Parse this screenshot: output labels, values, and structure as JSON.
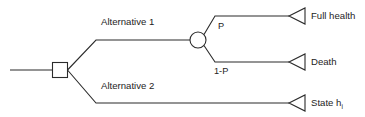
{
  "diagram": {
    "type": "decision-tree",
    "title": "",
    "colors": {
      "stroke": "#2b2b2b",
      "background": "#ffffff",
      "text": "#1d1d1d"
    },
    "nodes": {
      "root": {
        "shape": "square",
        "label": ""
      },
      "chance": {
        "shape": "circle",
        "label": ""
      },
      "terminal_full_health": {
        "shape": "triangle",
        "label": "Full health"
      },
      "terminal_death": {
        "shape": "triangle",
        "label": "Death"
      },
      "terminal_state": {
        "shape": "triangle",
        "label": "State h",
        "subscript": "i"
      }
    },
    "branches": {
      "alternative_1": "Alternative 1",
      "alternative_2": "Alternative 2",
      "probability_upper": "P",
      "probability_lower": "1-P"
    }
  }
}
